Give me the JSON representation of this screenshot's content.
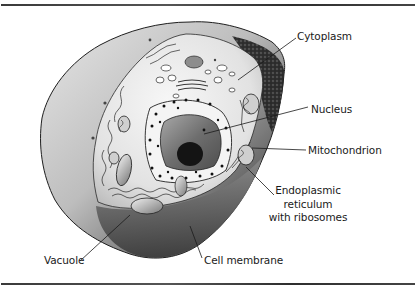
{
  "figure": {
    "type": "diagram",
    "labels": {
      "cytoplasm": "Cytoplasm",
      "nucleus": "Nucleus",
      "mitochondrion": "Mitochondrion",
      "er_line1": "Endoplasmic",
      "er_line2": "reticulum",
      "er_line3": "with ribosomes",
      "vacuole": "Vacuole",
      "cell_membrane": "Cell membrane"
    },
    "colors": {
      "rule": "#3a3a3a",
      "outline": "#1e1e1e",
      "membrane_light": "#d8d8d8",
      "membrane_dark": "#4a4a4a",
      "cytoplasm_fill": "#eeeeee",
      "nucleus_fill": "#6a6a6a",
      "nucleolus": "#151515"
    }
  }
}
